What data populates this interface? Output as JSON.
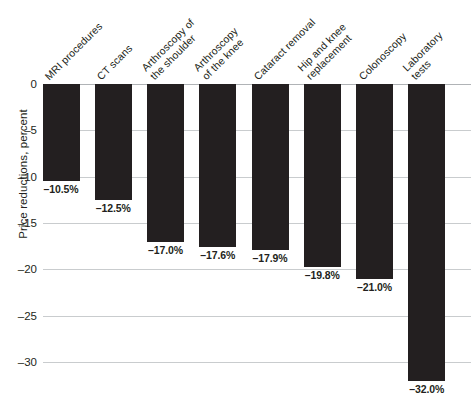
{
  "chart_data": {
    "type": "bar",
    "title": "",
    "subtitle": "",
    "xlabel": "",
    "ylabel": "Price reductions, percent",
    "orientation": "vertical",
    "grid": true,
    "legend": false,
    "ylim": [
      -33,
      0
    ],
    "yticks": [
      0,
      -5,
      -10,
      -15,
      -20,
      -25,
      -30
    ],
    "ytick_labels": [
      "0",
      "–5",
      "–10",
      "–15",
      "–20",
      "–25",
      "–30"
    ],
    "categories": [
      "MRI procedures",
      "CT scans",
      "Arthroscopy of the shoulder",
      "Arthroscopy of the knee",
      "Cataract removal",
      "Hip and knee replacement",
      "Colonoscopy",
      "Laboratory tests"
    ],
    "category_lines": [
      [
        "MRI procedures"
      ],
      [
        "CT scans"
      ],
      [
        "Arthroscopy of",
        "the shoulder"
      ],
      [
        "Arthroscopy",
        "of the knee"
      ],
      [
        "Cataract removal"
      ],
      [
        "Hip and knee",
        "replacement"
      ],
      [
        "Colonoscopy"
      ],
      [
        "Laboratory",
        "tests"
      ]
    ],
    "values": [
      -10.5,
      -12.5,
      -17.0,
      -17.6,
      -17.9,
      -19.8,
      -21.0,
      -32.0
    ],
    "data_labels": [
      "–10.5%",
      "–12.5%",
      "–17.0%",
      "–17.6%",
      "–17.9%",
      "–19.8%",
      "–21.0%",
      "–32.0%"
    ],
    "colors": {
      "bar": "#231f20",
      "grid": "#c9ccce",
      "text": "#231f20",
      "background": "#ffffff"
    }
  }
}
